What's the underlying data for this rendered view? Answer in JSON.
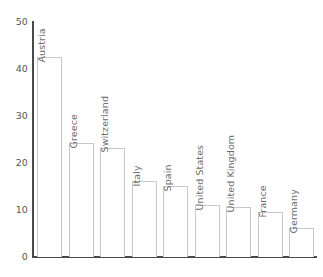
{
  "chart_data": {
    "type": "bar",
    "title": "",
    "subtitle": "",
    "xlabel": "",
    "ylabel": "",
    "categories": [
      "Austria",
      "Greece",
      "Switzerland",
      "Italy",
      "Spain",
      "United States",
      "United Kingdom",
      "France",
      "Germany"
    ],
    "values": [
      42.5,
      24.2,
      23.3,
      16.2,
      15.1,
      11.1,
      10.6,
      9.6,
      6.2
    ],
    "ylim": [
      0,
      50
    ],
    "yticks": [
      0,
      10,
      20,
      30,
      40,
      50
    ],
    "ytick_labels": [
      "0",
      "10",
      "20",
      "30",
      "40",
      "50"
    ],
    "grid": false,
    "legend": null,
    "legend_position": "none",
    "bar_fill_color": "#ffffff",
    "bar_border_color": "#c9c9c9",
    "axis_color": "#4a4a4a",
    "tick_label_color": "#555555",
    "category_label_color": "#6b6b6b",
    "background_color": "#ffffff",
    "orientation": "vertical",
    "label_rotation_degrees": 90,
    "label_placement": "above-bar"
  }
}
